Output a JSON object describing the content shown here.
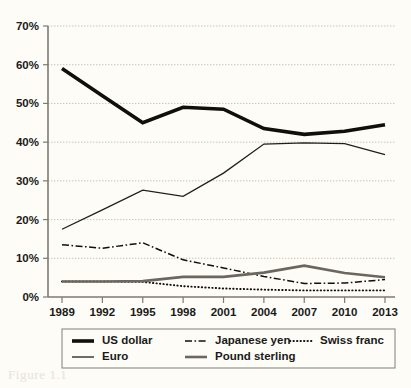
{
  "chart_data": {
    "type": "line",
    "title": "",
    "xlabel": "",
    "ylabel": "",
    "categories": [
      "1989",
      "1992",
      "1995",
      "1998",
      "2001",
      "2004",
      "2007",
      "2010",
      "2013"
    ],
    "ylim": [
      0,
      70
    ],
    "ytick_labels": [
      "0%",
      "10%",
      "20%",
      "30%",
      "40%",
      "50%",
      "60%",
      "70%"
    ],
    "ytick_values": [
      0,
      10,
      20,
      30,
      40,
      50,
      60,
      70
    ],
    "grid": true,
    "legend_position": "bottom",
    "series": [
      {
        "name": "US dollar",
        "style": "solid-thick",
        "color": "#100f0c",
        "width": 3.6,
        "dash": "none",
        "values": [
          59.0,
          52.0,
          45.0,
          49.0,
          48.5,
          43.5,
          42.0,
          42.8,
          44.5
        ]
      },
      {
        "name": "Japanese yen",
        "style": "dash-dot",
        "color": "#100f0c",
        "width": 1.5,
        "dash": "7 2.5 1.6 2.5",
        "values": [
          13.5,
          12.6,
          14.0,
          9.6,
          7.5,
          5.3,
          3.5,
          3.6,
          4.5
        ]
      },
      {
        "name": "Swiss franc",
        "style": "dotted",
        "color": "#100f0c",
        "width": 1.9,
        "dash": "0.4 3.1",
        "values": [
          4.0,
          4.0,
          3.9,
          2.8,
          2.2,
          1.9,
          1.7,
          1.7,
          1.7
        ]
      },
      {
        "name": "Euro",
        "style": "solid-thin",
        "color": "#201f1b",
        "width": 1.3,
        "dash": "none",
        "values": [
          17.5,
          22.5,
          27.6,
          26.0,
          32.0,
          39.5,
          39.8,
          39.6,
          36.8
        ]
      },
      {
        "name": "Pound sterling",
        "style": "solid-medium",
        "color": "#6a675e",
        "width": 2.6,
        "dash": "none",
        "values": [
          4.0,
          4.0,
          4.1,
          5.2,
          5.2,
          6.3,
          8.1,
          6.2,
          5.1
        ]
      }
    ]
  },
  "legend": {
    "entries": [
      {
        "label": "US dollar",
        "series": 0
      },
      {
        "label": "Japanese yen",
        "series": 1
      },
      {
        "label": "Swiss franc",
        "series": 2
      },
      {
        "label": "Euro",
        "series": 3
      },
      {
        "label": "Pound sterling",
        "series": 4
      }
    ]
  },
  "caption": {
    "text": "Figure 1.1"
  }
}
